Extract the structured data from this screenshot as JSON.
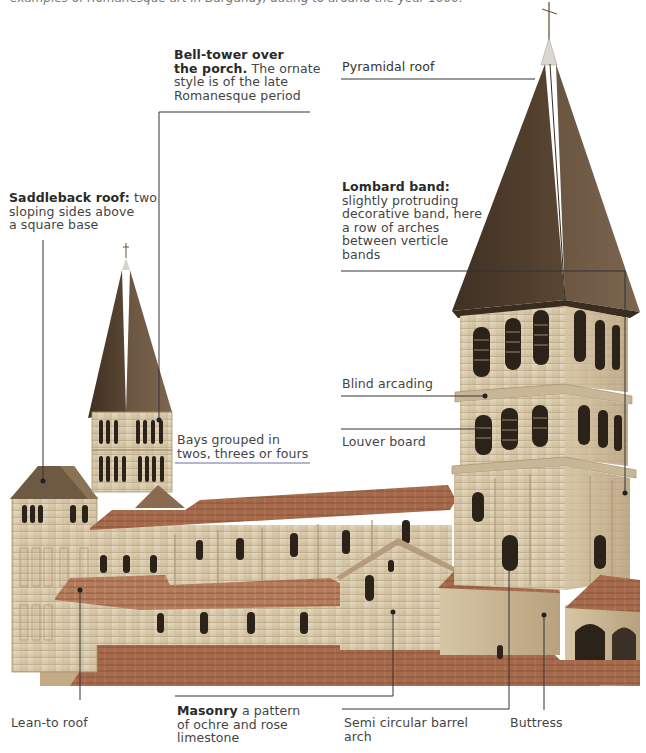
{
  "page": {
    "intro_text": "examples of Romanesque art in Burgundy, dating to around the year 1000."
  },
  "annotations": [
    {
      "id": "bell-tower",
      "term": "Bell-tower over the porch.",
      "description": "The ornate style is of the late Romanesque period"
    },
    {
      "id": "pyramidal-roof",
      "term": "Pyramidal roof",
      "description": ""
    },
    {
      "id": "saddleback-roof",
      "term": "Saddleback roof:",
      "description": "two sloping sides above a square base"
    },
    {
      "id": "lombard-band",
      "term": "Lombard band:",
      "description": "slightly protruding decorative band, here a row of arches between verticle bands"
    },
    {
      "id": "blind-arcading",
      "term": "Blind arcading",
      "description": ""
    },
    {
      "id": "louver-board",
      "term": "Louver board",
      "description": ""
    },
    {
      "id": "bays",
      "term": "Bays grouped in twos, threes or fours",
      "description": ""
    },
    {
      "id": "lean-to-roof",
      "term": "Lean-to roof",
      "description": ""
    },
    {
      "id": "masonry",
      "term": "Masonry",
      "description": "a pattern of ochre and rose limestone"
    },
    {
      "id": "barrel-arch",
      "term": "Semi circular barrel arch",
      "description": ""
    },
    {
      "id": "buttress",
      "term": "Buttress",
      "description": ""
    }
  ],
  "labels": {
    "bell_tower_term_l1": "Bell-tower over",
    "bell_tower_term_l2": "the porch.",
    "bell_tower_desc_l2": " The ornate",
    "bell_tower_desc_l3": "style is of the late",
    "bell_tower_desc_l4": "Romanesque period",
    "pyramidal_roof": "Pyramidal roof",
    "saddleback_term": "Saddleback roof:",
    "saddleback_desc_l1": " two",
    "saddleback_desc_l2": "sloping sides above",
    "saddleback_desc_l3": "a square base",
    "lombard_term": "Lombard band:",
    "lombard_desc_l2": "slightly protruding",
    "lombard_desc_l3": "decorative band, here",
    "lombard_desc_l4": "a row of arches",
    "lombard_desc_l5": "between verticle",
    "lombard_desc_l6": "bands",
    "blind_arcading": "Blind arcading",
    "louver_board": "Louver board",
    "bays_l1": "Bays grouped in",
    "bays_l2": "twos, threes or fours",
    "lean_to_roof": "Lean-to roof",
    "masonry_term": "Masonry",
    "masonry_desc_l1": " a pattern",
    "masonry_desc_l2": "of ochre and rose",
    "masonry_desc_l3": "limestone",
    "barrel_arch_l1": "Semi circular barrel",
    "barrel_arch_l2": "arch",
    "buttress": "Buttress"
  },
  "colors": {
    "roof_dark": "#4e3d2e",
    "roof_tile": "#a0664a",
    "stone": "#d9cbb0",
    "stone_shadow": "#b5a286",
    "window": "#2b2219",
    "leader_line": "#333333",
    "text": "#444444"
  }
}
